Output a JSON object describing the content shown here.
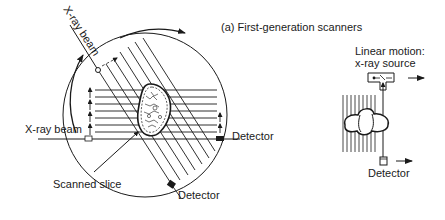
{
  "title": "(a) First-generation scanners",
  "labels": {
    "xray_beam_diagonal": "X-ray beam",
    "xray_beam_horizontal": "X-ray beam",
    "detector_right": "Detector",
    "detector_bottom": "Detector",
    "scanned_slice": "Scanned slice",
    "linear_motion_line1": "Linear motion:",
    "linear_motion_line2": "x-ray source",
    "detector_linear": "Detector"
  },
  "colors": {
    "ink": "#1a1a1a",
    "background": "#ffffff"
  }
}
